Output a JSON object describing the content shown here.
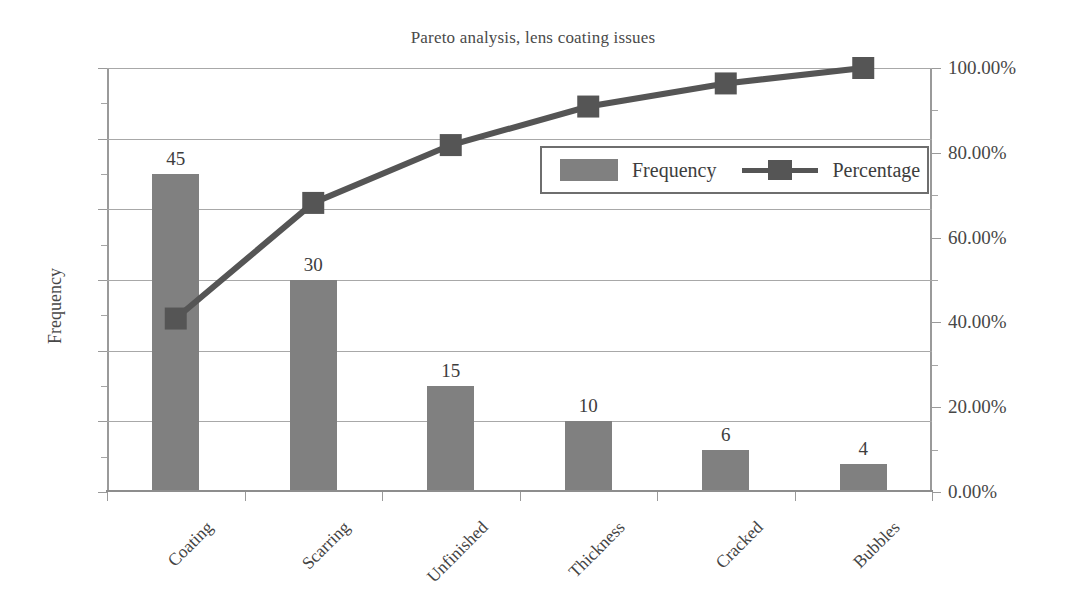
{
  "chart_data": {
    "type": "bar",
    "title": "Pareto analysis, lens coating issues",
    "xlabel": "",
    "ylabel": "Frequency",
    "categories": [
      "Coating",
      "Scarring",
      "Unfinished",
      "Thickness",
      "Cracked",
      "Bubbles"
    ],
    "series": [
      {
        "name": "Frequency",
        "kind": "bar",
        "axis": "left",
        "values": [
          45,
          30,
          15,
          10,
          6,
          4
        ],
        "labels": [
          "45",
          "30",
          "15",
          "10",
          "6",
          "4"
        ],
        "color": "#808080"
      },
      {
        "name": "Percentage",
        "kind": "line",
        "axis": "right",
        "values": [
          40.91,
          68.18,
          81.82,
          90.91,
          96.36,
          100.0
        ],
        "color": "#555555"
      }
    ],
    "ylim": [
      0,
      60
    ],
    "yticks": [
      0,
      10,
      20,
      30,
      40,
      50,
      60
    ],
    "ytick_labels": [
      "0",
      "10",
      "20",
      "30",
      "40",
      "50",
      "60"
    ],
    "y2lim": [
      0,
      100
    ],
    "y2ticks": [
      0,
      20,
      40,
      60,
      80,
      100
    ],
    "y2tick_labels": [
      "0.00%",
      "20.00%",
      "40.00%",
      "60.00%",
      "80.00%",
      "100.00%"
    ],
    "grid": true,
    "legend_position": "inside-upper-right",
    "legend_entries": [
      "Frequency",
      "Percentage"
    ]
  },
  "axes": {
    "left_title": "Frequency",
    "right_title": ""
  },
  "legend": {
    "frequency_label": "Frequency",
    "percentage_label": "Percentage"
  },
  "colors": {
    "bar": "#808080",
    "line": "#555555",
    "grid": "#a8a8a8",
    "axis": "#9a9a9a",
    "text": "#3d3d3d",
    "background": "#ffffff"
  }
}
